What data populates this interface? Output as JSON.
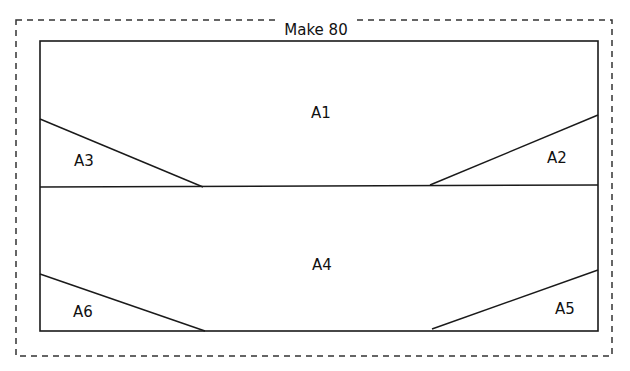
{
  "diagram": {
    "title": "Make 80",
    "pieces": [
      {
        "id": "A1",
        "label": "A1"
      },
      {
        "id": "A2",
        "label": "A2"
      },
      {
        "id": "A3",
        "label": "A3"
      },
      {
        "id": "A4",
        "label": "A4"
      },
      {
        "id": "A5",
        "label": "A5"
      },
      {
        "id": "A6",
        "label": "A6"
      }
    ],
    "colors": {
      "stroke": "#1a1a1a",
      "dashed": "#333333",
      "background": "#ffffff"
    }
  }
}
